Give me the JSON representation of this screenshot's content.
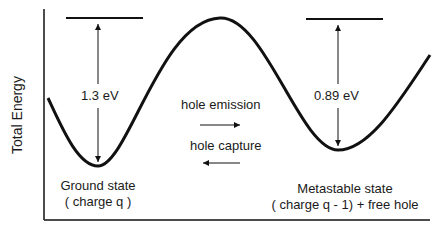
{
  "diagram": {
    "type": "configuration-coordinate energy diagram",
    "y_axis_label": "Total Energy",
    "left_well": {
      "state_label": "Ground state",
      "charge_label": "( charge q )",
      "barrier_energy": "1.3 eV"
    },
    "right_well": {
      "state_label": "Metastable state",
      "charge_label": "( charge q - 1) + free hole",
      "barrier_energy": "0.89 eV"
    },
    "transitions": {
      "forward": "hole emission",
      "backward": "hole capture"
    },
    "colors": {
      "line": "#111111",
      "background": "#ffffff"
    }
  }
}
